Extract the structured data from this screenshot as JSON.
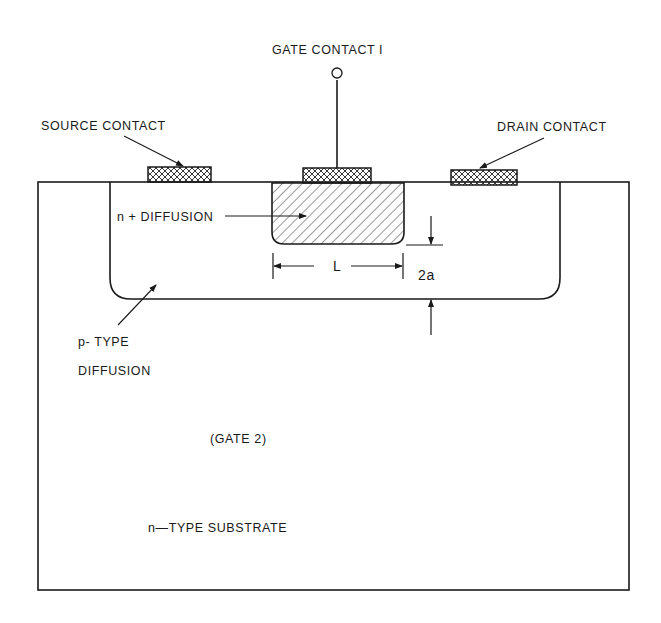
{
  "diagram": {
    "type": "cross-section",
    "labels": {
      "gate_contact_1": "GATE CONTACT I",
      "source_contact": "SOURCE CONTACT",
      "drain_contact": "DRAIN CONTACT",
      "n_plus_diffusion": "n + DIFFUSION",
      "length": "L",
      "thickness": "2a",
      "p_type_line1": "p- TYPE",
      "p_type_line2": "DIFFUSION",
      "gate_2": "(GATE 2)",
      "substrate": "n—TYPE SUBSTRATE"
    },
    "regions": [
      {
        "name": "n-type substrate",
        "fill": "none"
      },
      {
        "name": "p-type diffusion",
        "fill": "none"
      },
      {
        "name": "n+ diffusion",
        "fill": "diagonal-hatch"
      },
      {
        "name": "source contact",
        "fill": "cross-hatch"
      },
      {
        "name": "gate contact 1",
        "fill": "cross-hatch"
      },
      {
        "name": "drain contact",
        "fill": "cross-hatch"
      }
    ],
    "colors": {
      "ink": "#1a1a1a",
      "background": "#ffffff"
    }
  }
}
